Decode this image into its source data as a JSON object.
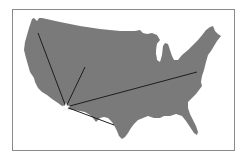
{
  "map": {
    "subject": "Contiguous United States",
    "colors": {
      "land": "#7a7a7a",
      "background": "#ffffff",
      "frame": "#8a8a8a",
      "route_line": "#1e1e1e",
      "origin_marker": "#ffffff"
    },
    "origin": {
      "marker": "star-icon",
      "x": 66,
      "y": 107
    },
    "routes": [
      {
        "direction": "northwest",
        "x1": 66,
        "y1": 107,
        "x2": 38,
        "y2": 33
      },
      {
        "direction": "north",
        "x1": 66,
        "y1": 107,
        "x2": 85,
        "y2": 67
      },
      {
        "direction": "east",
        "x1": 66,
        "y1": 107,
        "x2": 197,
        "y2": 72
      },
      {
        "direction": "southeast",
        "x1": 66,
        "y1": 107,
        "x2": 114,
        "y2": 125
      }
    ]
  }
}
